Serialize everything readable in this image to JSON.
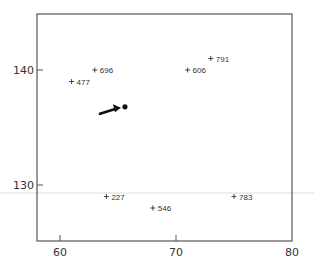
{
  "chart_data": {
    "type": "scatter",
    "title": "",
    "xlabel": "",
    "ylabel": "",
    "xlim": [
      58,
      80
    ],
    "ylim": [
      125,
      145
    ],
    "x_ticks": [
      60,
      70,
      80
    ],
    "y_ticks": [
      130,
      140
    ],
    "grid": false,
    "legend": null,
    "marker": "+",
    "points": [
      {
        "label": "696",
        "x": 63,
        "y": 140
      },
      {
        "label": "477",
        "x": 61,
        "y": 139
      },
      {
        "label": "791",
        "x": 73,
        "y": 141
      },
      {
        "label": "606",
        "x": 71,
        "y": 140
      },
      {
        "label": "227",
        "x": 64,
        "y": 129
      },
      {
        "label": "546",
        "x": 68,
        "y": 128
      },
      {
        "label": "783",
        "x": 75,
        "y": 129
      }
    ],
    "highlight": {
      "x": 65.6,
      "y": 136.8,
      "marker": "filled-dot",
      "annotation": "arrow pointing to dot"
    },
    "overlay_line": {
      "y_pixel": 193,
      "color": "#d8d8d8",
      "note": "faint horizontal line spanning full width"
    }
  },
  "axes": {
    "x_tick_labels": [
      "60",
      "70",
      "80"
    ],
    "y_tick_labels": [
      "130",
      "140"
    ]
  },
  "colors": {
    "axis": "#555555",
    "text": "#333333",
    "marker": "#333333",
    "highlight": "#111111"
  }
}
